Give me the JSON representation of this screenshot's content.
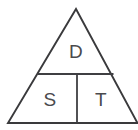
{
  "figure": {
    "name": "dst-formula-triangle",
    "background_color": "#ffffff",
    "line_color": "#3a3a3c",
    "text_color": "#4a4a4d",
    "geometry": {
      "width": 138,
      "height": 130,
      "apex": [
        76,
        9
      ],
      "bottom_left": [
        8,
        123
      ],
      "bottom_right": [
        137,
        123
      ],
      "horizontal_divider": {
        "y": 74,
        "x_start": 38,
        "x_end": 113
      },
      "vertical_divider": {
        "x": 77,
        "y_start": 74,
        "y_end": 123
      }
    },
    "cells": [
      {
        "id": "top",
        "label": "D",
        "center": [
          76,
          51
        ]
      },
      {
        "id": "bottom-left",
        "label": "S",
        "center": [
          50,
          99
        ]
      },
      {
        "id": "bottom-right",
        "label": "T",
        "center": [
          101,
          99
        ]
      }
    ]
  }
}
